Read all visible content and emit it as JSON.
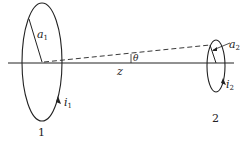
{
  "diagram": {
    "loop1": {
      "label": "1",
      "radius_label": "a",
      "radius_sub": "1",
      "current_label": "i",
      "current_sub": "1"
    },
    "loop2": {
      "label": "2",
      "radius_label": "a",
      "radius_sub": "2",
      "current_label": "i",
      "current_sub": "2"
    },
    "axis_label": "z",
    "angle_label": "θ",
    "colors": {
      "stroke": "#222222",
      "background": "#ffffff"
    }
  }
}
